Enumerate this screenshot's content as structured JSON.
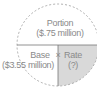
{
  "diagram": {
    "type": "portion-base-rate-circle",
    "top": {
      "title": "Portion",
      "value": "($.75 million)"
    },
    "bottom_left": {
      "title": "Base",
      "value": "($3.55 million)"
    },
    "operator": "×",
    "bottom_right": {
      "title": "Rate",
      "value": "(?)"
    },
    "colors": {
      "outline": "#9a9a9a",
      "shade": "#d9d9d9",
      "text": "#8a8a8a"
    }
  }
}
